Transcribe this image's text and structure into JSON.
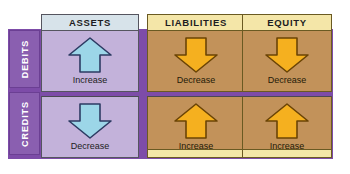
{
  "diagram": {
    "colors": {
      "backdrop_purple": "#7d4ca8",
      "tab_purple": "#8a5fb0",
      "assets_body": "#c3b2da",
      "assets_header": "#d7e3ea",
      "tan_body": "#c2925a",
      "cream_header": "#f4e6a8",
      "arrow_blue_fill": "#9cd6e8",
      "arrow_blue_stroke": "#2d3b63",
      "arrow_orange_fill": "#f5b01f",
      "arrow_orange_stroke": "#6b4405"
    }
  },
  "rows": [
    {
      "key": "debits",
      "label": "DEBITS"
    },
    {
      "key": "credits",
      "label": "CREDITS"
    }
  ],
  "columns": [
    {
      "key": "assets",
      "header": "ASSETS"
    },
    {
      "key": "liabilities",
      "header": "LIABILITIES"
    },
    {
      "key": "equity",
      "header": "EQUITY"
    }
  ],
  "cells": {
    "debits": {
      "assets": {
        "caption": "Increase",
        "arrow": "arrow-up-icon",
        "direction": "up",
        "color": "blue"
      },
      "liabilities": {
        "caption": "Decrease",
        "arrow": "arrow-down-icon",
        "direction": "down",
        "color": "orange"
      },
      "equity": {
        "caption": "Decrease",
        "arrow": "arrow-down-icon",
        "direction": "down",
        "color": "orange"
      }
    },
    "credits": {
      "assets": {
        "caption": "Decrease",
        "arrow": "arrow-down-icon",
        "direction": "down",
        "color": "blue"
      },
      "liabilities": {
        "caption": "Increase",
        "arrow": "arrow-up-icon",
        "direction": "up",
        "color": "orange"
      },
      "equity": {
        "caption": "Increase",
        "arrow": "arrow-up-icon",
        "direction": "up",
        "color": "orange"
      }
    }
  }
}
